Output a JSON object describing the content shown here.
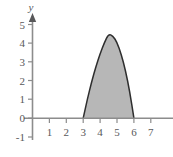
{
  "chart_data": {
    "type": "area",
    "title": "",
    "subtitle": "",
    "xlabel": "",
    "ylabel": "y",
    "xlim": [
      0,
      7.6
    ],
    "ylim": [
      -1,
      5.3
    ],
    "grid": false,
    "legend": null,
    "x_ticks": [
      1,
      2,
      3,
      4,
      5,
      6,
      7
    ],
    "x_tick_labels": [
      "1",
      "2",
      "3",
      "4",
      "5",
      "6",
      "7"
    ],
    "y_ticks": [
      -1,
      0,
      1,
      2,
      3,
      4,
      5
    ],
    "y_tick_labels": [
      "-1",
      "0",
      "1",
      "2",
      "3",
      "4",
      "5"
    ],
    "y_axis_label": "y",
    "curve": {
      "description": "downward parabola",
      "roots": [
        3,
        6
      ],
      "vertex_x": 4.5,
      "vertex_y": 4.5,
      "equation": "y = -2(x-3)(x-6)/1.5",
      "points": [
        {
          "x": 3.0,
          "y": 0.0
        },
        {
          "x": 3.25,
          "y": 1.03
        },
        {
          "x": 3.5,
          "y": 1.94
        },
        {
          "x": 3.75,
          "y": 2.75
        },
        {
          "x": 4.0,
          "y": 3.44
        },
        {
          "x": 4.25,
          "y": 4.03
        },
        {
          "x": 4.5,
          "y": 4.5
        },
        {
          "x": 4.75,
          "y": 4.4
        },
        {
          "x": 5.0,
          "y": 4.06
        },
        {
          "x": 5.25,
          "y": 3.42
        },
        {
          "x": 5.5,
          "y": 2.56
        },
        {
          "x": 5.75,
          "y": 1.44
        },
        {
          "x": 6.0,
          "y": 0.0
        }
      ]
    },
    "shaded_region": {
      "from_x": 3,
      "to_x": 6,
      "baseline_y": 0,
      "fill_color": "#b7b7b7"
    },
    "colors": {
      "background": "#ffffff",
      "axis": "#8c8c8c",
      "text": "#58585a",
      "curve_stroke": "#2e2e2e",
      "region_fill": "#b7b7b7"
    }
  }
}
